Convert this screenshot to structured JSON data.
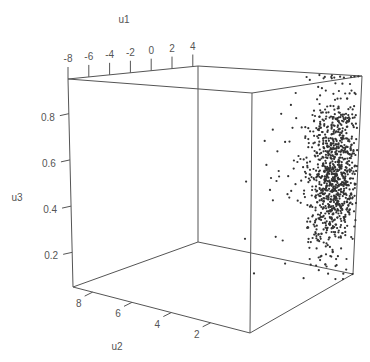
{
  "chart_data": {
    "type": "scatter",
    "projection": "3d",
    "title": "",
    "axes": {
      "x": {
        "label": "u1",
        "range": [
          -8,
          4.5
        ],
        "ticks": [
          -8,
          -6,
          -4,
          -2,
          0,
          2,
          4
        ],
        "tick_labels": [
          "-8",
          "-6",
          "-4",
          "-2",
          "0",
          "2",
          "4"
        ]
      },
      "y": {
        "label": "u2",
        "range": [
          0,
          9
        ],
        "ticks": [
          2,
          4,
          6,
          8
        ],
        "tick_labels": [
          "2",
          "4",
          "6",
          "8"
        ]
      },
      "z": {
        "label": "u3",
        "range": [
          0.05,
          0.95
        ],
        "ticks": [
          0.2,
          0.4,
          0.6,
          0.8
        ],
        "tick_labels": [
          "0.2",
          "0.4",
          "0.6",
          "0.8"
        ]
      }
    },
    "box": true,
    "grid": false,
    "legend": "none",
    "series": [
      {
        "name": "points",
        "count": 1000,
        "description": "Dense cloud concentrated near u1 in [2,4.5], u2 roughly 0-3, u3 broadly 0.1-0.95 peaking around 0.5; sparse outliers toward negative u1",
        "distribution": {
          "u1": {
            "core_mean": 3.2,
            "core_sd": 0.9,
            "outlier_fraction": 0.04,
            "outlier_min": -4.5
          },
          "u2": {
            "mean": 1.2,
            "sd": 0.9,
            "min": 0
          },
          "u3": {
            "mean": 0.52,
            "sd": 0.18,
            "min": 0.05,
            "max": 0.95
          }
        },
        "seed": 12345
      }
    ]
  }
}
